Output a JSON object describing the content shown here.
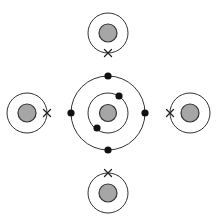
{
  "diagram": {
    "colors": {
      "nucleus_fill": "#a6a6a6",
      "line": "#333333",
      "electron": "#111111",
      "background": "#ffffff"
    },
    "central_atom": {
      "name": "central-atom",
      "shells": [
        {
          "name": "inner-shell",
          "electrons": 2,
          "electron_symbol": "dot"
        },
        {
          "name": "outer-shell",
          "electrons": 4,
          "electron_symbol": "dot"
        }
      ]
    },
    "surrounding_atoms": [
      {
        "name": "top-atom",
        "position": "top",
        "electrons": 1,
        "electron_symbol": "cross",
        "electron_side": "bottom"
      },
      {
        "name": "left-atom",
        "position": "left",
        "electrons": 1,
        "electron_symbol": "cross",
        "electron_side": "right"
      },
      {
        "name": "right-atom",
        "position": "right",
        "electrons": 1,
        "electron_symbol": "cross",
        "electron_side": "left"
      },
      {
        "name": "bottom-atom",
        "position": "bottom",
        "electrons": 1,
        "electron_symbol": "cross",
        "electron_side": "top"
      }
    ]
  }
}
